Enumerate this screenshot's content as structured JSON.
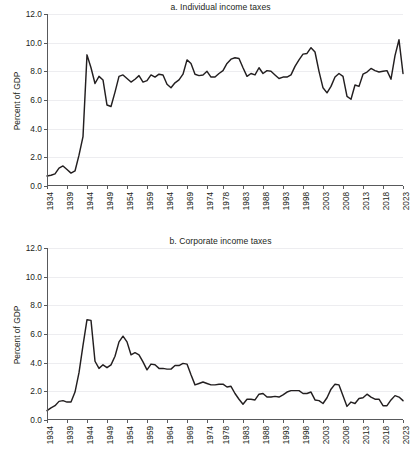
{
  "figure": {
    "ylabel": "Percent of GDP",
    "line_color": "#231f20",
    "grid_color": "#ededf0",
    "axis_color": "#58595b"
  },
  "chart_data": [
    {
      "type": "line",
      "panel": "a",
      "title": "a. Individual income taxes",
      "xlabel": "",
      "ylabel": "Percent of GDP",
      "ylim": [
        0.0,
        12.0
      ],
      "yticks": [
        0.0,
        2.0,
        4.0,
        6.0,
        8.0,
        10.0,
        12.0
      ],
      "ytick_labels": [
        "0.0",
        "2.0",
        "4.0",
        "6.0",
        "8.0",
        "10.0",
        "12.0"
      ],
      "xlim": [
        1934,
        2023
      ],
      "xticks": [
        1934,
        1939,
        1944,
        1949,
        1954,
        1959,
        1964,
        1969,
        1974,
        1978,
        1983,
        1988,
        1993,
        1998,
        2003,
        2008,
        2013,
        2018,
        2023
      ],
      "xtick_labels": [
        "1934",
        "1939",
        "1944",
        "1949",
        "1954",
        "1959",
        "1964",
        "1969",
        "1974",
        "1978",
        "1983",
        "1988",
        "1993",
        "1998",
        "2003",
        "2008",
        "2013",
        "2018",
        "2023"
      ],
      "grid": true,
      "legend": "none",
      "x": [
        1934,
        1935,
        1936,
        1937,
        1938,
        1939,
        1940,
        1941,
        1942,
        1943,
        1944,
        1945,
        1946,
        1947,
        1948,
        1949,
        1950,
        1951,
        1952,
        1953,
        1954,
        1955,
        1956,
        1957,
        1958,
        1959,
        1960,
        1961,
        1962,
        1963,
        1964,
        1965,
        1966,
        1967,
        1968,
        1969,
        1970,
        1971,
        1972,
        1973,
        1974,
        1975,
        1976,
        1977,
        1978,
        1979,
        1980,
        1981,
        1982,
        1983,
        1984,
        1985,
        1986,
        1987,
        1988,
        1989,
        1990,
        1991,
        1992,
        1993,
        1994,
        1995,
        1996,
        1997,
        1998,
        1999,
        2000,
        2001,
        2002,
        2003,
        2004,
        2005,
        2006,
        2007,
        2008,
        2009,
        2010,
        2011,
        2012,
        2013,
        2014,
        2015,
        2016,
        2017,
        2018,
        2019,
        2020,
        2021,
        2022,
        2023
      ],
      "values": [
        0.7,
        0.75,
        0.85,
        1.25,
        1.4,
        1.15,
        0.9,
        1.05,
        2.15,
        3.45,
        9.15,
        8.25,
        7.15,
        7.65,
        7.4,
        5.65,
        5.55,
        6.55,
        7.65,
        7.75,
        7.5,
        7.25,
        7.45,
        7.7,
        7.25,
        7.35,
        7.75,
        7.6,
        7.8,
        7.75,
        7.1,
        6.85,
        7.2,
        7.4,
        7.8,
        8.8,
        8.55,
        7.8,
        7.7,
        7.75,
        8.0,
        7.6,
        7.6,
        7.85,
        8.05,
        8.55,
        8.85,
        8.95,
        8.9,
        8.25,
        7.65,
        7.85,
        7.75,
        8.25,
        7.85,
        8.05,
        8.0,
        7.75,
        7.5,
        7.6,
        7.6,
        7.75,
        8.35,
        8.8,
        9.2,
        9.25,
        9.65,
        9.35,
        8.0,
        6.85,
        6.5,
        6.95,
        7.6,
        7.85,
        7.65,
        6.25,
        6.05,
        7.05,
        6.95,
        7.8,
        7.95,
        8.2,
        8.05,
        7.95,
        8.0,
        8.05,
        7.45,
        9.1,
        10.2,
        7.85
      ]
    },
    {
      "type": "line",
      "panel": "b",
      "title": "b. Corporate income taxes",
      "xlabel": "",
      "ylabel": "Percent of GDP",
      "ylim": [
        0.0,
        12.0
      ],
      "yticks": [
        0.0,
        2.0,
        4.0,
        6.0,
        8.0,
        10.0,
        12.0
      ],
      "ytick_labels": [
        "0.0",
        "2.0",
        "4.0",
        "6.0",
        "8.0",
        "10.0",
        "12.0"
      ],
      "xlim": [
        1934,
        2023
      ],
      "xticks": [
        1934,
        1939,
        1944,
        1949,
        1954,
        1959,
        1964,
        1969,
        1974,
        1978,
        1983,
        1988,
        1993,
        1998,
        2003,
        2008,
        2013,
        2018,
        2023
      ],
      "xtick_labels": [
        "1934",
        "1939",
        "1944",
        "1949",
        "1954",
        "1959",
        "1964",
        "1969",
        "1974",
        "1978",
        "1983",
        "1988",
        "1993",
        "1998",
        "2003",
        "2008",
        "2013",
        "2018",
        "2023"
      ],
      "grid": true,
      "legend": "none",
      "x": [
        1934,
        1935,
        1936,
        1937,
        1938,
        1939,
        1940,
        1941,
        1942,
        1943,
        1944,
        1945,
        1946,
        1947,
        1948,
        1949,
        1950,
        1951,
        1952,
        1953,
        1954,
        1955,
        1956,
        1957,
        1958,
        1959,
        1960,
        1961,
        1962,
        1963,
        1964,
        1965,
        1966,
        1967,
        1968,
        1969,
        1970,
        1971,
        1972,
        1973,
        1974,
        1975,
        1976,
        1977,
        1978,
        1979,
        1980,
        1981,
        1982,
        1983,
        1984,
        1985,
        1986,
        1987,
        1988,
        1989,
        1990,
        1991,
        1992,
        1993,
        1994,
        1995,
        1996,
        1997,
        1998,
        1999,
        2000,
        2001,
        2002,
        2003,
        2004,
        2005,
        2006,
        2007,
        2008,
        2009,
        2010,
        2011,
        2012,
        2013,
        2014,
        2015,
        2016,
        2017,
        2018,
        2019,
        2020,
        2021,
        2022,
        2023
      ],
      "values": [
        0.65,
        0.85,
        1.0,
        1.3,
        1.35,
        1.25,
        1.25,
        1.95,
        3.3,
        5.2,
        7.0,
        6.95,
        4.1,
        3.6,
        3.85,
        3.65,
        3.85,
        4.45,
        5.45,
        5.85,
        5.45,
        4.55,
        4.7,
        4.55,
        4.05,
        3.5,
        3.9,
        3.85,
        3.6,
        3.6,
        3.55,
        3.55,
        3.8,
        3.8,
        3.95,
        3.9,
        3.15,
        2.45,
        2.55,
        2.65,
        2.55,
        2.45,
        2.45,
        2.5,
        2.5,
        2.3,
        2.35,
        1.85,
        1.45,
        1.1,
        1.45,
        1.45,
        1.4,
        1.8,
        1.85,
        1.6,
        1.6,
        1.65,
        1.6,
        1.75,
        1.95,
        2.05,
        2.05,
        2.05,
        1.85,
        1.85,
        1.95,
        1.4,
        1.35,
        1.15,
        1.55,
        2.15,
        2.5,
        2.45,
        1.7,
        0.95,
        1.25,
        1.15,
        1.5,
        1.55,
        1.8,
        1.6,
        1.45,
        1.45,
        1.0,
        1.0,
        1.4,
        1.7,
        1.6,
        1.35
      ]
    }
  ]
}
